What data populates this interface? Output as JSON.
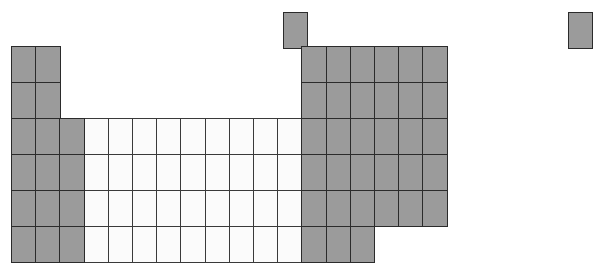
{
  "figure": {
    "kind": "periodic-table-outline",
    "title": "",
    "colors": {
      "main_group_fill": "#9b9b9b",
      "transition_fill": "#fbfbfb",
      "border": "#2b2b2b",
      "background": "#ffffff"
    }
  },
  "grid": {
    "columns": 18,
    "rows": 7,
    "cell_width": 24.2,
    "cell_height": 36.0,
    "origin_x": 11,
    "origin_y": 46,
    "period1_y": 12,
    "notes": "Period 1 sits on its own offset row; period 7 stops after group 15"
  },
  "chart_data": {
    "type": "table",
    "title": "",
    "categories": [
      "group-1",
      "group-2",
      "group-3",
      "group-4",
      "group-5",
      "group-6",
      "group-7",
      "group-8",
      "group-9",
      "group-10",
      "group-11",
      "group-12",
      "group-13",
      "group-14",
      "group-15",
      "group-16",
      "group-17",
      "group-18"
    ],
    "cells": [
      {
        "id": "c-p1-g1",
        "col": 1,
        "row": 1,
        "fill": "main",
        "x": 283,
        "y": 12,
        "w": 24,
        "h": 36
      },
      {
        "id": "c-p1-g18",
        "col": 18,
        "row": 1,
        "fill": "main",
        "x": 568,
        "y": 12,
        "w": 24,
        "h": 36
      },
      {
        "id": "c-p2-g1",
        "col": 1,
        "row": 2,
        "fill": "main",
        "x": 11,
        "y": 46,
        "w": 24,
        "h": 36
      },
      {
        "id": "c-p2-g2",
        "col": 2,
        "row": 2,
        "fill": "main",
        "x": 35,
        "y": 46,
        "w": 24,
        "h": 36
      },
      {
        "id": "c-p2-g13",
        "col": 13,
        "row": 2,
        "fill": "main",
        "x": 481,
        "y": 46,
        "w": 24,
        "h": 36
      },
      {
        "id": "c-p2-g14",
        "col": 14,
        "row": 2,
        "fill": "main",
        "x": 505,
        "y": 46,
        "w": 24,
        "h": 36
      },
      {
        "id": "c-p2-g15",
        "col": 15,
        "row": 2,
        "fill": "main",
        "x": 529,
        "y": 46,
        "w": 24,
        "h": 36
      },
      {
        "id": "c-p2-g16",
        "col": 16,
        "row": 2,
        "fill": "main",
        "x": 553,
        "y": 46,
        "w": 24,
        "h": 36
      },
      {
        "id": "c-p2-g17",
        "col": 17,
        "row": 2,
        "fill": "main",
        "x": 577,
        "y": 46,
        "w": 24,
        "h": 36
      },
      {
        "id": "c-p2-g18",
        "col": 18,
        "row": 2,
        "fill": "main",
        "x": 568,
        "y": 46,
        "w": 24,
        "h": 36
      },
      {
        "id": "c-p3-g1",
        "col": 1,
        "row": 3,
        "fill": "main"
      },
      {
        "id": "c-p3-g2",
        "col": 2,
        "row": 3,
        "fill": "main"
      },
      {
        "id": "c-p4-g1",
        "col": 1,
        "row": 4,
        "fill": "main"
      },
      {
        "id": "c-p4-g2",
        "col": 2,
        "row": 4,
        "fill": "main"
      },
      {
        "id": "c-p4-g3",
        "col": 3,
        "row": 4,
        "fill": "main"
      },
      {
        "id": "c-p5-g1",
        "col": 1,
        "row": 5,
        "fill": "main"
      },
      {
        "id": "c-p5-g2",
        "col": 2,
        "row": 5,
        "fill": "main"
      },
      {
        "id": "c-p5-g3",
        "col": 3,
        "row": 5,
        "fill": "main"
      },
      {
        "id": "c-p6-g1",
        "col": 1,
        "row": 6,
        "fill": "main"
      },
      {
        "id": "c-p6-g2",
        "col": 2,
        "row": 6,
        "fill": "main"
      },
      {
        "id": "c-p6-g3",
        "col": 3,
        "row": 6,
        "fill": "main"
      },
      {
        "id": "c-p7-g1",
        "col": 1,
        "row": 7,
        "fill": "main"
      },
      {
        "id": "c-p7-g2",
        "col": 2,
        "row": 7,
        "fill": "main"
      },
      {
        "id": "c-p7-g3",
        "col": 3,
        "row": 7,
        "fill": "main"
      }
    ],
    "blocks": [
      {
        "name": "s-block-left",
        "fill": "main",
        "col_start": 1,
        "col_end": 2,
        "row_start": 2,
        "row_end": 7
      },
      {
        "name": "d-block",
        "fill": "transition",
        "col_start": 4,
        "col_end": 12,
        "row_start": 4,
        "row_end": 7,
        "truncated_row7_col_end": 12
      },
      {
        "name": "p-block",
        "fill": "main",
        "col_start": 13,
        "col_end": 18,
        "row_start": 2,
        "row_end": 6,
        "row7_col_end": 15
      }
    ],
    "xlabel": "",
    "ylabel": "",
    "legend": [],
    "grid_lines": true
  },
  "layout_rows": [
    {
      "index": 1,
      "label": "period-1",
      "y": 12
    },
    {
      "index": 2,
      "label": "period-2",
      "y": 46
    },
    {
      "index": 3,
      "label": "period-3",
      "y": 82
    },
    {
      "index": 4,
      "label": "period-4",
      "y": 118
    },
    {
      "index": 5,
      "label": "period-5",
      "y": 154
    },
    {
      "index": 6,
      "label": "period-6",
      "y": 190
    },
    {
      "index": 7,
      "label": "period-7",
      "y": 226
    }
  ]
}
